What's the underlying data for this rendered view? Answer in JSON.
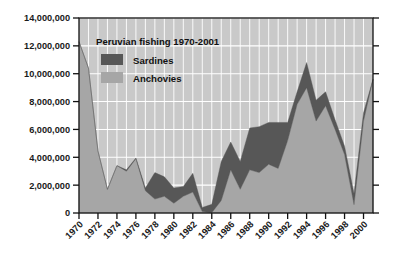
{
  "chart_data": {
    "type": "area",
    "stacked": true,
    "title": "Peruvian fishing 1970-2001",
    "xlabel": "",
    "ylabel": "",
    "xlim": [
      1970,
      2001
    ],
    "ylim": [
      0,
      14000000
    ],
    "grid": true,
    "legend_position": "top-left-inside",
    "y_ticks": [
      0,
      2000000,
      4000000,
      6000000,
      8000000,
      10000000,
      12000000,
      14000000
    ],
    "y_tick_labels": [
      "0",
      "2,000,000",
      "4,000,000",
      "6,000,000",
      "8,000,000",
      "10,000,000",
      "12,000,000",
      "14,000,000"
    ],
    "x_ticks": [
      1970,
      1972,
      1974,
      1976,
      1978,
      1980,
      1982,
      1984,
      1986,
      1988,
      1990,
      1992,
      1994,
      1996,
      1998,
      2000
    ],
    "x_tick_labels": [
      "1970",
      "1972",
      "1974",
      "1976",
      "1978",
      "1980",
      "1982",
      "1984",
      "1986",
      "1988",
      "1990",
      "1992",
      "1994",
      "1996",
      "1998",
      "2000"
    ],
    "x": [
      1970,
      1971,
      1972,
      1973,
      1974,
      1975,
      1976,
      1977,
      1978,
      1979,
      1980,
      1981,
      1982,
      1983,
      1984,
      1985,
      1986,
      1987,
      1988,
      1989,
      1990,
      1991,
      1992,
      1993,
      1994,
      1995,
      1996,
      1997,
      1998,
      1999,
      2000,
      2001
    ],
    "series": [
      {
        "name": "Anchovies",
        "color": "#a6a6a6",
        "values": [
          12300000,
          10400000,
          4450000,
          1700000,
          3400000,
          3000000,
          3900000,
          1600000,
          1000000,
          1200000,
          700000,
          1200000,
          1500000,
          100000,
          20000,
          900000,
          3100000,
          1700000,
          3100000,
          2900000,
          3500000,
          3200000,
          5200000,
          7800000,
          9000000,
          6600000,
          7700000,
          6000000,
          4200000,
          600000,
          6600000,
          9600000
        ],
        "stack_order": 1
      },
      {
        "name": "Sardines",
        "color": "#575757",
        "values": [
          0,
          0,
          0,
          0,
          0,
          100000,
          50000,
          200000,
          1900000,
          1400000,
          1100000,
          700000,
          1350000,
          300000,
          600000,
          2800000,
          2000000,
          2000000,
          3000000,
          3300000,
          3000000,
          3300000,
          1300000,
          900000,
          1800000,
          1500000,
          1000000,
          700000,
          600000,
          800000,
          600000,
          0
        ],
        "stack_order": 2
      }
    ],
    "totals": [
      12300000,
      10400000,
      4450000,
      1700000,
      3400000,
      3100000,
      3950000,
      1800000,
      2900000,
      2600000,
      1800000,
      1900000,
      2850000,
      400000,
      620000,
      3700000,
      5100000,
      3700000,
      6100000,
      6200000,
      6500000,
      6500000,
      6500000,
      8700000,
      10800000,
      8100000,
      8700000,
      6700000,
      4800000,
      1400000,
      7200000,
      9600000
    ]
  },
  "legend": {
    "items": [
      {
        "label": "Sardines",
        "color": "#575757"
      },
      {
        "label": "Anchovies",
        "color": "#a6a6a6"
      }
    ]
  },
  "colors": {
    "plot_background": "#c9c9c9",
    "grid": "#ffffff",
    "axis": "#111111",
    "sardines": "#575757",
    "anchovies": "#a6a6a6",
    "page_background": "#ffffff",
    "text": "#111111"
  }
}
